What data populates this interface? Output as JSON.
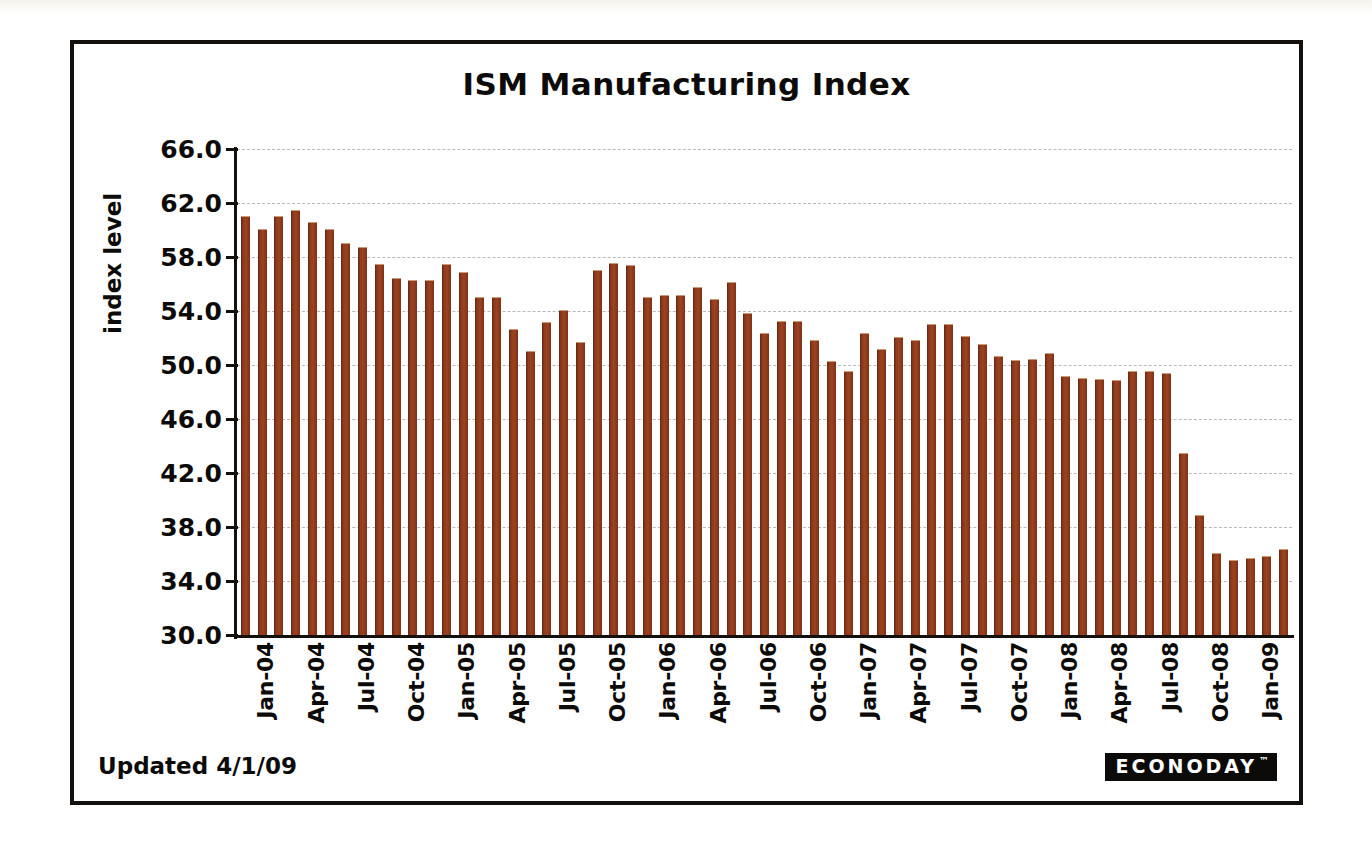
{
  "chart_data": {
    "type": "bar",
    "title": "ISM Manufacturing Index",
    "xlabel": "",
    "ylabel": "index level",
    "ylim": [
      30.0,
      66.0
    ],
    "ytick_step": 4.0,
    "ytick_labels": [
      "66.0",
      "62.0",
      "58.0",
      "54.0",
      "50.0",
      "46.0",
      "42.0",
      "38.0",
      "34.0",
      "30.0"
    ],
    "ytick_values": [
      66.0,
      62.0,
      58.0,
      54.0,
      50.0,
      46.0,
      42.0,
      38.0,
      34.0,
      30.0
    ],
    "grid": true,
    "grid_style": "dashed-horizontal",
    "legend": false,
    "bar_color": "#8d3a1c",
    "tick_labels_visible": [
      "Jan-04",
      "Apr-04",
      "Jul-04",
      "Oct-04",
      "Jan-05",
      "Apr-05",
      "Jul-05",
      "Oct-05",
      "Jan-06",
      "Apr-06",
      "Jul-06",
      "Oct-06",
      "Jan-07",
      "Apr-07",
      "Jul-07",
      "Oct-07",
      "Jan-08",
      "Apr-08",
      "Jul-08",
      "Oct-08",
      "Jan-09"
    ],
    "tick_label_every": 3,
    "categories": [
      "Jan-04",
      "Feb-04",
      "Mar-04",
      "Apr-04",
      "May-04",
      "Jun-04",
      "Jul-04",
      "Aug-04",
      "Sep-04",
      "Oct-04",
      "Nov-04",
      "Dec-04",
      "Jan-05",
      "Feb-05",
      "Mar-05",
      "Apr-05",
      "May-05",
      "Jun-05",
      "Jul-05",
      "Aug-05",
      "Sep-05",
      "Oct-05",
      "Nov-05",
      "Dec-05",
      "Jan-06",
      "Feb-06",
      "Mar-06",
      "Apr-06",
      "May-06",
      "Jun-06",
      "Jul-06",
      "Aug-06",
      "Sep-06",
      "Oct-06",
      "Nov-06",
      "Dec-06",
      "Jan-07",
      "Feb-07",
      "Mar-07",
      "Apr-07",
      "May-07",
      "Jun-07",
      "Jul-07",
      "Aug-07",
      "Sep-07",
      "Oct-07",
      "Nov-07",
      "Dec-07",
      "Jan-08",
      "Feb-08",
      "Mar-08",
      "Apr-08",
      "May-08",
      "Jun-08",
      "Jul-08",
      "Aug-08",
      "Sep-08",
      "Oct-08",
      "Nov-08",
      "Dec-08",
      "Jan-09",
      "Feb-09",
      "Mar-09"
    ],
    "values": [
      61.0,
      60.0,
      61.0,
      61.4,
      60.5,
      60.0,
      59.0,
      58.7,
      57.4,
      56.4,
      56.2,
      56.2,
      57.4,
      56.8,
      55.0,
      55.0,
      52.6,
      51.0,
      53.1,
      54.0,
      51.6,
      57.0,
      57.5,
      57.3,
      55.0,
      55.1,
      55.1,
      55.7,
      54.8,
      56.1,
      53.8,
      52.3,
      53.2,
      53.2,
      51.8,
      50.2,
      49.5,
      52.3,
      51.1,
      52.0,
      51.8,
      53.0,
      53.0,
      52.1,
      51.5,
      50.6,
      50.3,
      50.4,
      50.8,
      49.1,
      49.0,
      48.9,
      48.8,
      49.5,
      49.5,
      49.3,
      43.4,
      38.8,
      36.0,
      35.5,
      35.6,
      35.8,
      36.3
    ]
  },
  "footer": {
    "updated_text": "Updated 4/1/09",
    "brand": "ECONODAY",
    "trademark": "™"
  }
}
